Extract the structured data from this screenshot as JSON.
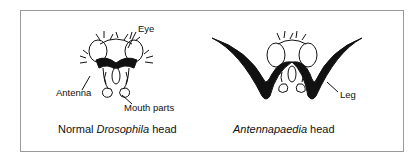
{
  "left_panel": {
    "labels": {
      "eye": "Eye",
      "antenna": "Antenna",
      "mouth_parts": "Mouth parts"
    },
    "caption_prefix": "Normal ",
    "caption_italic": "Drosophila",
    "caption_suffix": " head"
  },
  "right_panel": {
    "labels": {
      "leg": "Leg"
    },
    "caption_italic": "Antennapaedia",
    "caption_suffix": " head"
  },
  "colors": {
    "border": "#9a9a9a",
    "ink": "#111111"
  }
}
